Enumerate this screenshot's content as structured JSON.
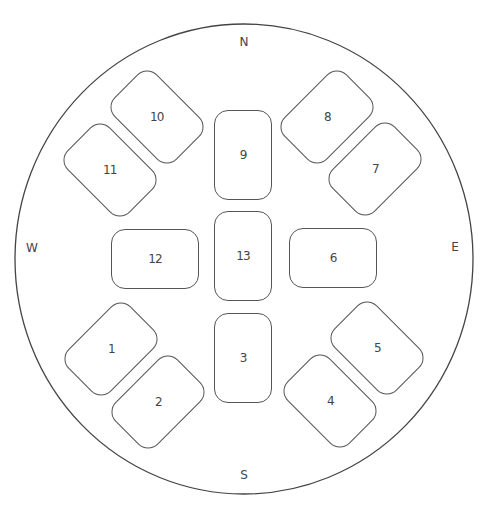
{
  "floor": {
    "shape": "circle",
    "center": [
      244,
      259
    ],
    "radius_x": 229,
    "radius_y": 235,
    "stroke_color": "#444444"
  },
  "compass": {
    "north": {
      "label": "N",
      "pos": [
        244,
        42
      ]
    },
    "south": {
      "label": "S",
      "pos": [
        244,
        475
      ]
    },
    "west": {
      "label": "W",
      "pos": [
        32,
        248
      ]
    },
    "east": {
      "label": "E",
      "pos": [
        455,
        247
      ]
    }
  },
  "tables": [
    {
      "id": "1",
      "label": "1",
      "center": [
        111,
        349
      ],
      "w": 88,
      "h": 60,
      "rotate": -45
    },
    {
      "id": "2",
      "label": "2",
      "center": [
        158,
        402
      ],
      "w": 88,
      "h": 60,
      "rotate": -45
    },
    {
      "id": "3",
      "label": "3",
      "center": [
        243,
        358
      ],
      "w": 58,
      "h": 90,
      "rotate": 0
    },
    {
      "id": "4",
      "label": "4",
      "center": [
        330,
        401
      ],
      "w": 88,
      "h": 60,
      "rotate": 45
    },
    {
      "id": "5",
      "label": "5",
      "center": [
        377,
        348
      ],
      "w": 88,
      "h": 60,
      "rotate": 45
    },
    {
      "id": "6",
      "label": "6",
      "center": [
        333,
        258
      ],
      "w": 88,
      "h": 60,
      "rotate": 0
    },
    {
      "id": "7",
      "label": "7",
      "center": [
        375,
        169
      ],
      "w": 88,
      "h": 60,
      "rotate": -45
    },
    {
      "id": "8",
      "label": "8",
      "center": [
        327,
        117
      ],
      "w": 88,
      "h": 60,
      "rotate": -45
    },
    {
      "id": "9",
      "label": "9",
      "center": [
        243,
        155
      ],
      "w": 58,
      "h": 90,
      "rotate": 0
    },
    {
      "id": "10",
      "label": "10",
      "center": [
        157,
        117
      ],
      "w": 88,
      "h": 60,
      "rotate": 45
    },
    {
      "id": "11",
      "label": "11",
      "center": [
        110,
        170
      ],
      "w": 88,
      "h": 60,
      "rotate": 45
    },
    {
      "id": "12",
      "label": "12",
      "center": [
        155,
        259
      ],
      "w": 88,
      "h": 60,
      "rotate": 0
    },
    {
      "id": "13",
      "label": "13",
      "center": [
        243,
        256
      ],
      "w": 58,
      "h": 90,
      "rotate": 0
    }
  ]
}
